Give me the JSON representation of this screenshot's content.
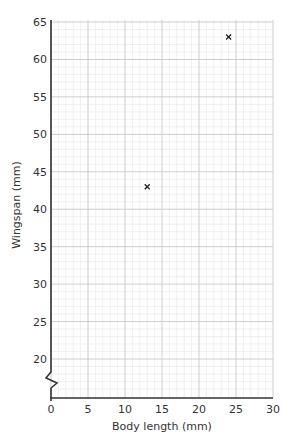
{
  "chart_data": {
    "type": "scatter",
    "title": "",
    "xlabel": "Body length (mm)",
    "ylabel": "Wingspan (mm)",
    "xlim": [
      0,
      30
    ],
    "ylim": [
      15,
      65
    ],
    "y_axis_break": true,
    "x_ticks": [
      0,
      5,
      10,
      15,
      20,
      25,
      30
    ],
    "y_ticks": [
      20,
      25,
      30,
      35,
      40,
      45,
      50,
      55,
      60,
      65
    ],
    "grid": true,
    "marker": "x",
    "points": [
      {
        "x": 13,
        "y": 43
      },
      {
        "x": 24,
        "y": 63
      }
    ]
  },
  "colors": {
    "axis": "#333333",
    "grid_major": "#c8c8c8",
    "grid_minor": "#e6e6e6",
    "marker": "#222222"
  }
}
